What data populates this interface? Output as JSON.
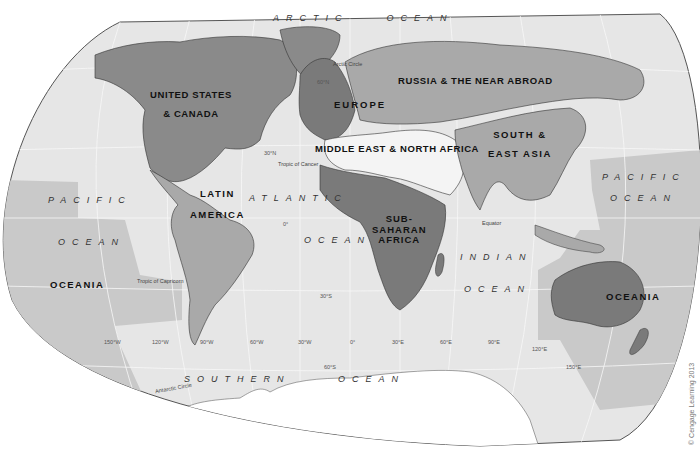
{
  "map": {
    "projection": "world-oval",
    "colors": {
      "ocean": "#e6e6e6",
      "ocean_oceania_zone": "#c9c9c9",
      "land_dark": "#8a8a8a",
      "land_medium": "#a9a9a9",
      "land_light": "#f4f4f4",
      "antarctica": "#ffffff",
      "border": "#333333",
      "outline": "#555555"
    },
    "regions": [
      {
        "id": "us-canada",
        "line1": "UNITED STATES",
        "line2": "& CANADA"
      },
      {
        "id": "europe",
        "label": "EUROPE"
      },
      {
        "id": "russia",
        "label": "RUSSIA & THE NEAR ABROAD"
      },
      {
        "id": "mena",
        "label": "MIDDLE EAST & NORTH AFRICA"
      },
      {
        "id": "south-east-asia",
        "line1": "SOUTH &",
        "line2": "EAST ASIA"
      },
      {
        "id": "latin-america",
        "line1": "LATIN",
        "line2": "AMERICA"
      },
      {
        "id": "sub-saharan-africa",
        "line1": "SUB-",
        "line2": "SAHARAN",
        "line3": "AFRICA"
      },
      {
        "id": "oceania-west",
        "label": "OCEANIA"
      },
      {
        "id": "oceania-east",
        "label": "OCEANIA"
      }
    ],
    "oceans": {
      "arctic": "ARCTIC    OCEAN",
      "pacific_west_1": "PACIFIC",
      "pacific_west_2": "OCEAN",
      "pacific_east_1": "PACIFIC",
      "pacific_east_2": "OCEAN",
      "atlantic_1": "ATLANTIC",
      "atlantic_2": "OCEAN",
      "indian_1": "INDIAN",
      "indian_2": "OCEAN",
      "southern": "SOUTHERN     OCEAN"
    },
    "lines": {
      "arctic_circle": "Arctic Circle",
      "tropic_cancer": "Tropic of Cancer",
      "equator": "Equator",
      "tropic_capricorn": "Tropic of Capricorn",
      "antarctic_circle": "Antarctic Circle"
    },
    "grid_labels": {
      "lat_60n": "60°N",
      "lat_30n": "30°N",
      "lat_0": "0°",
      "lat_30s": "30°S",
      "lat_60s": "60°S",
      "lon_150w": "150°W",
      "lon_120w": "120°W",
      "lon_90w": "90°W",
      "lon_60w": "60°W",
      "lon_30w": "30°W",
      "lon_0": "0°",
      "lon_30e": "30°E",
      "lon_60e": "60°E",
      "lon_90e": "90°E",
      "lon_120e": "120°E",
      "lon_150e": "150°E"
    },
    "credit": "© Cengage Learning 2013"
  }
}
